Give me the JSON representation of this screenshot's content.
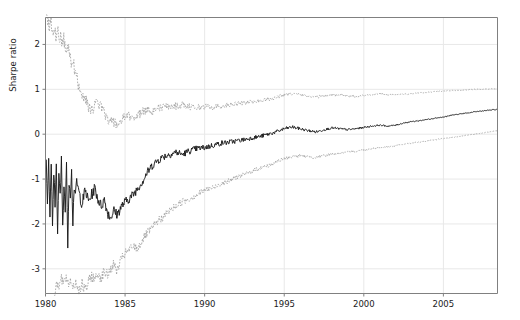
{
  "chart_data": {
    "type": "line",
    "title": "",
    "xlabel": "",
    "ylabel": "Sharpe ratio",
    "xlim": [
      1980.0,
      2008.4
    ],
    "ylim": [
      -3.55,
      2.6
    ],
    "xticks": [
      1980,
      1985,
      1990,
      1995,
      2000,
      2005
    ],
    "xtick_labels": [
      "1980",
      "1985",
      "1990",
      "1995",
      "2000",
      "2005"
    ],
    "yticks": [
      -3,
      -2,
      -1,
      0,
      1,
      2
    ],
    "ytick_labels": [
      "-3",
      "-2",
      "-1",
      "0",
      "1",
      "2"
    ],
    "grid": true,
    "legend": "none",
    "colors": {
      "center_line": "#1a1a1a",
      "band_line": "#9a9a9a",
      "grid": "#e8e8e8",
      "spine": "#808080",
      "background": "#ffffff"
    },
    "series": [
      {
        "name": "upper confidence band",
        "style": "dotted",
        "color": "#9a9a9a",
        "x": [
          1980.05,
          1980.15,
          1980.25,
          1980.35,
          1980.45,
          1980.55,
          1980.65,
          1980.75,
          1980.85,
          1980.95,
          1981.05,
          1981.15,
          1981.25,
          1981.35,
          1981.45,
          1981.55,
          1981.65,
          1981.75,
          1981.85,
          1981.95,
          1982.1,
          1982.3,
          1982.5,
          1982.7,
          1982.9,
          1983.1,
          1983.3,
          1983.5,
          1983.7,
          1983.9,
          1984.1,
          1984.3,
          1984.5,
          1984.7,
          1984.9,
          1985.2,
          1985.5,
          1985.8,
          1986.1,
          1986.4,
          1986.7,
          1987.0,
          1987.4,
          1987.8,
          1988.2,
          1988.6,
          1989.0,
          1989.5,
          1990.0,
          1990.5,
          1991.0,
          1991.5,
          1992.0,
          1992.5,
          1993.0,
          1993.5,
          1994.0,
          1994.5,
          1995.0,
          1995.5,
          1996.0,
          1996.5,
          1997.0,
          1997.5,
          1998.0,
          1998.5,
          1999.0,
          1999.5,
          2000.0,
          2000.5,
          2001.0,
          2001.5,
          2002.0,
          2002.5,
          2003.0,
          2003.5,
          2004.0,
          2004.5,
          2005.0,
          2005.5,
          2006.0,
          2006.5,
          2007.0,
          2007.5,
          2008.0,
          2008.4
        ],
        "y": [
          2.6,
          2.55,
          2.4,
          2.5,
          2.3,
          2.45,
          2.2,
          2.35,
          2.1,
          2.25,
          2.0,
          2.15,
          1.9,
          1.8,
          1.95,
          1.7,
          1.55,
          1.6,
          1.4,
          1.3,
          1.05,
          0.9,
          0.78,
          0.62,
          0.55,
          0.62,
          0.72,
          0.6,
          0.48,
          0.35,
          0.3,
          0.25,
          0.2,
          0.28,
          0.35,
          0.4,
          0.38,
          0.42,
          0.5,
          0.55,
          0.52,
          0.58,
          0.6,
          0.62,
          0.63,
          0.65,
          0.62,
          0.6,
          0.62,
          0.6,
          0.63,
          0.65,
          0.68,
          0.7,
          0.72,
          0.75,
          0.78,
          0.82,
          0.88,
          0.9,
          0.88,
          0.85,
          0.83,
          0.85,
          0.88,
          0.87,
          0.85,
          0.84,
          0.86,
          0.88,
          0.9,
          0.88,
          0.87,
          0.89,
          0.9,
          0.92,
          0.93,
          0.95,
          0.96,
          0.97,
          0.98,
          0.99,
          1.0,
          1.0,
          1.01,
          1.02
        ]
      },
      {
        "name": "point estimate",
        "style": "solid",
        "color": "#1a1a1a",
        "x": [
          1980.05,
          1980.12,
          1980.2,
          1980.28,
          1980.36,
          1980.44,
          1980.52,
          1980.6,
          1980.68,
          1980.76,
          1980.84,
          1980.92,
          1981.0,
          1981.08,
          1981.16,
          1981.24,
          1981.32,
          1981.4,
          1981.48,
          1981.56,
          1981.64,
          1981.72,
          1981.8,
          1981.88,
          1981.96,
          1982.1,
          1982.3,
          1982.5,
          1982.7,
          1982.9,
          1983.1,
          1983.3,
          1983.5,
          1983.7,
          1983.9,
          1984.1,
          1984.3,
          1984.5,
          1984.7,
          1984.9,
          1985.2,
          1985.5,
          1985.8,
          1986.1,
          1986.4,
          1986.7,
          1987.0,
          1987.4,
          1987.8,
          1988.2,
          1988.6,
          1989.0,
          1989.5,
          1990.0,
          1990.5,
          1991.0,
          1991.5,
          1992.0,
          1992.5,
          1993.0,
          1993.5,
          1994.0,
          1994.5,
          1995.0,
          1995.5,
          1996.0,
          1996.5,
          1997.0,
          1997.5,
          1998.0,
          1998.5,
          1999.0,
          1999.5,
          2000.0,
          2000.5,
          2001.0,
          2001.5,
          2002.0,
          2002.5,
          2003.0,
          2003.5,
          2004.0,
          2004.5,
          2005.0,
          2005.5,
          2006.0,
          2006.5,
          2007.0,
          2007.5,
          2008.0,
          2008.4
        ],
        "y": [
          -0.5,
          -1.5,
          -0.6,
          -1.9,
          -0.7,
          -2.1,
          -0.8,
          -1.6,
          -0.55,
          -2.3,
          -0.9,
          -1.4,
          -0.6,
          -2.0,
          -1.1,
          -1.7,
          -0.75,
          -2.4,
          -1.0,
          -1.3,
          -0.85,
          -1.95,
          -1.15,
          -1.45,
          -1.05,
          -1.3,
          -1.55,
          -1.25,
          -1.5,
          -1.35,
          -1.2,
          -1.45,
          -1.6,
          -1.45,
          -1.75,
          -1.85,
          -1.7,
          -1.8,
          -1.65,
          -1.55,
          -1.45,
          -1.35,
          -1.2,
          -1.05,
          -0.85,
          -0.7,
          -0.6,
          -0.5,
          -0.45,
          -0.4,
          -0.45,
          -0.38,
          -0.32,
          -0.3,
          -0.25,
          -0.2,
          -0.18,
          -0.15,
          -0.12,
          -0.08,
          -0.05,
          0.0,
          0.05,
          0.12,
          0.16,
          0.12,
          0.08,
          0.05,
          0.1,
          0.14,
          0.12,
          0.1,
          0.12,
          0.15,
          0.18,
          0.2,
          0.18,
          0.2,
          0.25,
          0.28,
          0.3,
          0.33,
          0.36,
          0.38,
          0.42,
          0.45,
          0.47,
          0.5,
          0.52,
          0.54,
          0.55
        ]
      },
      {
        "name": "lower confidence band",
        "style": "dotted",
        "color": "#9a9a9a",
        "x": [
          1980.55,
          1980.7,
          1980.85,
          1981.0,
          1981.15,
          1981.3,
          1981.45,
          1981.6,
          1981.75,
          1981.9,
          1982.1,
          1982.3,
          1982.5,
          1982.7,
          1982.9,
          1983.1,
          1983.3,
          1983.5,
          1983.7,
          1983.9,
          1984.1,
          1984.3,
          1984.5,
          1984.7,
          1984.9,
          1985.2,
          1985.5,
          1985.8,
          1986.1,
          1986.4,
          1986.7,
          1987.0,
          1987.4,
          1987.8,
          1988.2,
          1988.6,
          1989.0,
          1989.5,
          1990.0,
          1990.5,
          1991.0,
          1991.5,
          1992.0,
          1992.5,
          1993.0,
          1993.5,
          1994.0,
          1994.5,
          1995.0,
          1995.5,
          1996.0,
          1996.5,
          1997.0,
          1997.5,
          1998.0,
          1998.5,
          1999.0,
          1999.5,
          2000.0,
          2000.5,
          2001.0,
          2001.5,
          2002.0,
          2002.5,
          2003.0,
          2003.5,
          2004.0,
          2004.5,
          2005.0,
          2005.5,
          2006.0,
          2006.5,
          2007.0,
          2007.5,
          2008.0,
          2008.4
        ],
        "y": [
          -3.5,
          -3.3,
          -3.45,
          -3.2,
          -3.4,
          -3.15,
          -3.35,
          -3.25,
          -3.4,
          -3.3,
          -3.45,
          -3.35,
          -3.5,
          -3.3,
          -3.15,
          -3.25,
          -3.1,
          -3.2,
          -3.05,
          -3.15,
          -3.0,
          -2.9,
          -3.05,
          -2.85,
          -2.7,
          -2.6,
          -2.5,
          -2.55,
          -2.35,
          -2.2,
          -2.1,
          -1.95,
          -1.85,
          -1.7,
          -1.6,
          -1.5,
          -1.45,
          -1.35,
          -1.25,
          -1.2,
          -1.1,
          -1.05,
          -0.95,
          -0.9,
          -0.82,
          -0.75,
          -0.7,
          -0.62,
          -0.55,
          -0.5,
          -0.48,
          -0.5,
          -0.52,
          -0.48,
          -0.44,
          -0.42,
          -0.4,
          -0.38,
          -0.35,
          -0.32,
          -0.3,
          -0.28,
          -0.26,
          -0.22,
          -0.2,
          -0.18,
          -0.15,
          -0.12,
          -0.1,
          -0.08,
          -0.05,
          -0.02,
          0.0,
          0.03,
          0.06,
          0.08
        ]
      }
    ]
  }
}
